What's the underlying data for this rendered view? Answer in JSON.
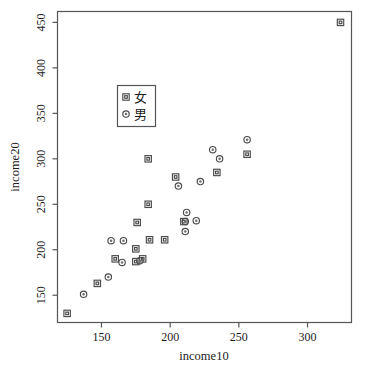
{
  "chart_data": {
    "type": "scatter",
    "title": "",
    "xlabel": "income10",
    "ylabel": "income20",
    "xlim": [
      118,
      332
    ],
    "ylim": [
      120,
      462
    ],
    "xticks": [
      150,
      200,
      250,
      300
    ],
    "yticks": [
      150,
      200,
      250,
      300,
      350,
      400,
      450
    ],
    "grid": false,
    "legend_position": "upper-left-inside",
    "series": [
      {
        "name": "女",
        "marker": "square",
        "points": [
          [
            125,
            130
          ],
          [
            147,
            163
          ],
          [
            160,
            190
          ],
          [
            175,
            187
          ],
          [
            175,
            201
          ],
          [
            176,
            230
          ],
          [
            180,
            190
          ],
          [
            184,
            250
          ],
          [
            184,
            300
          ],
          [
            185,
            211
          ],
          [
            196,
            211
          ],
          [
            204,
            280
          ],
          [
            210,
            231
          ],
          [
            234,
            285
          ],
          [
            256,
            305
          ],
          [
            324,
            450
          ]
        ]
      },
      {
        "name": "男",
        "marker": "circle",
        "points": [
          [
            137,
            151
          ],
          [
            155,
            170
          ],
          [
            157,
            210
          ],
          [
            165,
            186
          ],
          [
            166,
            210
          ],
          [
            178,
            188
          ],
          [
            206,
            270
          ],
          [
            211,
            220
          ],
          [
            211,
            231
          ],
          [
            212,
            241
          ],
          [
            219,
            232
          ],
          [
            222,
            275
          ],
          [
            231,
            310
          ],
          [
            236,
            300
          ],
          [
            256,
            321
          ]
        ]
      }
    ]
  },
  "axes": {
    "x_title": "income10",
    "y_title": "income20",
    "x_tick_labels": [
      "150",
      "200",
      "250",
      "300"
    ],
    "y_tick_labels": [
      "150",
      "200",
      "250",
      "300",
      "350",
      "400",
      "450"
    ]
  },
  "legend": {
    "entries": [
      {
        "label": "女",
        "marker": "square-marker-icon"
      },
      {
        "label": "男",
        "marker": "circle-marker-icon"
      }
    ]
  },
  "colors": {
    "background": "#ffffff",
    "frame": "#555555",
    "marker": "#4a4a4a",
    "text": "#1c1c1c"
  }
}
